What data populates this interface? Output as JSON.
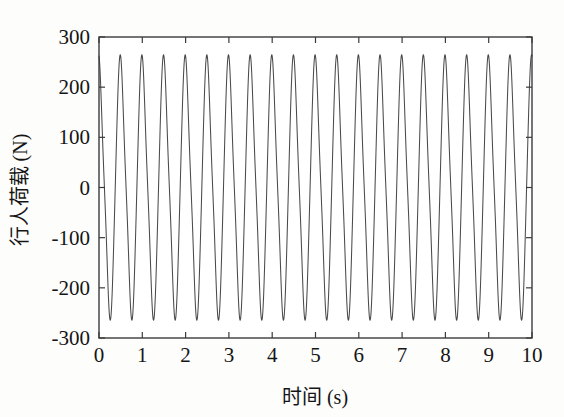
{
  "chart_data": {
    "type": "line",
    "title": "",
    "xlabel": "时间 (s)",
    "ylabel": "行人荷载 (N)",
    "xlim": [
      0,
      10
    ],
    "ylim": [
      -300,
      300
    ],
    "xticks": [
      0,
      1,
      2,
      3,
      4,
      5,
      6,
      7,
      8,
      9,
      10
    ],
    "xtick_labels": [
      "0",
      "1",
      "2",
      "3",
      "4",
      "5",
      "6",
      "7",
      "8",
      "9",
      "10"
    ],
    "yticks": [
      -300,
      -200,
      -100,
      0,
      100,
      200,
      300
    ],
    "ytick_labels": [
      "-300",
      "-200",
      "-100",
      "0",
      "100",
      "200",
      "300"
    ],
    "grid": false,
    "legend": null,
    "series": [
      {
        "name": "行人荷载",
        "color": "#4a4a4a",
        "linewidth": 1.05,
        "frequency_hz": 2.0,
        "period_s": 0.5,
        "amplitude_n": 275,
        "mean_n": 0,
        "n_cycles": 20,
        "peak_value": 277,
        "trough_value": -275,
        "waveform": "harmonic-sum sharp-peaked sinusoid",
        "harmonics": [
          {
            "order": 1,
            "amplitude": 250,
            "phase_deg": 90
          },
          {
            "order": 2,
            "amplitude": 22,
            "phase_deg": 180
          },
          {
            "order": 3,
            "amplitude": 12,
            "phase_deg": 90
          }
        ],
        "samples_per_cycle": 72
      }
    ]
  },
  "axes": {
    "frame_color": "#3b3b3b",
    "tick_direction": "in",
    "box": true,
    "background": "#fdfdfc"
  }
}
